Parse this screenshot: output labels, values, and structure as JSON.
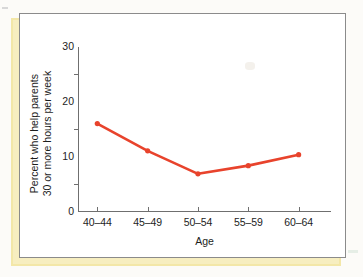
{
  "figure": {
    "frame_border_color": "#8b8b8b",
    "shadow_color": "#f3e7a8",
    "panel_background": "#ffffff"
  },
  "chart_data": {
    "type": "line",
    "title": "",
    "subtitle": "",
    "xlabel": "Age",
    "ylabel": "Percent who help parents\n30 or more hours per week",
    "ylabel_line1": "Percent who help parents",
    "ylabel_line2": "30 or more hours per week",
    "categories": [
      "40–44",
      "45–49",
      "50–54",
      "55–59",
      "60–64"
    ],
    "values": [
      16.0,
      11.0,
      6.8,
      8.3,
      10.3
    ],
    "ylim": [
      0,
      30
    ],
    "ytick_labels": [
      "0",
      "10",
      "20",
      "30"
    ],
    "ytick_values": [
      0,
      10,
      20,
      30
    ],
    "y_minor_ticks": [
      5,
      15,
      25
    ],
    "grid": false,
    "legend": false,
    "legend_position": "none",
    "series": [
      {
        "name": "Percent who help parents 30 or more hours per week",
        "values": [
          16.0,
          11.0,
          6.8,
          8.3,
          10.3
        ],
        "color": "#e8432c",
        "marker": "circle",
        "marker_color": "#e8432c",
        "line_width": 2.6
      }
    ],
    "annotations": []
  },
  "colors": {
    "series_red": "#e8432c",
    "axis_gray": "#6f6f6f",
    "text_black": "#1d1d1d",
    "shadow_yellow": "#f3e7a8"
  }
}
